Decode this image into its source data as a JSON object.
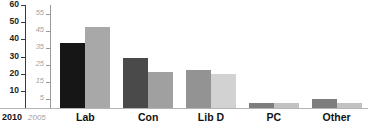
{
  "chart_data": {
    "type": "bar",
    "title": "",
    "subtitle": "",
    "xlabel": "",
    "ylabel": "",
    "categories": [
      "Lab",
      "Con",
      "Lib D",
      "PC",
      "Other"
    ],
    "series": [
      {
        "name": "2010",
        "color": "#1b1b1b",
        "values": [
          38,
          29,
          22,
          3,
          5
        ]
      },
      {
        "name": "2005",
        "color": "#a8a8a8",
        "values": [
          47,
          21,
          20,
          3,
          3
        ]
      }
    ],
    "bar_colors": {
      "2010": [
        "#161616",
        "#4a4a4a",
        "#939393",
        "#7e7e7e",
        "#7e7e7e"
      ],
      "2005": [
        "#a8a8a8",
        "#a0a0a0",
        "#d2d2d2",
        "#c2c2c2",
        "#c2c2c2"
      ]
    },
    "axes": {
      "left_2010": {
        "label": "2010",
        "ticks": [
          60,
          50,
          40,
          30,
          20,
          10
        ],
        "range": [
          0,
          60
        ],
        "color": "#1d1d1d"
      },
      "left_2005": {
        "label": "2005",
        "ticks": [
          55,
          45,
          35,
          25,
          15,
          5
        ],
        "range": [
          0,
          60
        ],
        "color": "#a2a2a2"
      }
    },
    "grid": false,
    "legend_position": "bottom-left",
    "baseline_color": "#b4b4b4"
  }
}
